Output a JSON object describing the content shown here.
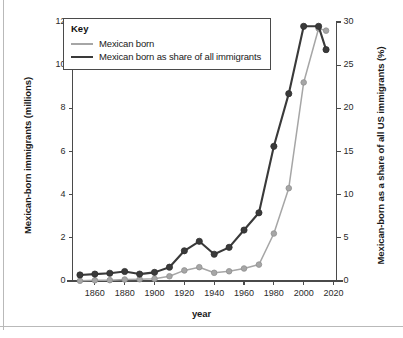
{
  "chart_data": {
    "type": "line",
    "title": "",
    "xlabel": "year",
    "ylabel": "Mexican-born immigrants (millions)",
    "ylabel_right": "Mexican-born as a share of all US immigrants (%)",
    "xlim": [
      1845,
      2022
    ],
    "ylim": [
      0,
      12
    ],
    "ylim_right": [
      0,
      30
    ],
    "xticks": [
      1860,
      1880,
      1900,
      1920,
      1940,
      1960,
      1980,
      2000,
      2020
    ],
    "xtick_labels": [
      "1860",
      "1880",
      "1900",
      "1920",
      "1940",
      "1960",
      "1980",
      "2000",
      "2020"
    ],
    "yticks": [
      0,
      2,
      4,
      6,
      8,
      10,
      12
    ],
    "ytick_labels": [
      "0",
      "2",
      "4",
      "6",
      "8",
      "10",
      "12"
    ],
    "yticks_right": [
      0,
      5,
      10,
      15,
      20,
      25,
      30
    ],
    "ytick_labels_right": [
      "0",
      "5",
      "10",
      "15",
      "20",
      "25",
      "30"
    ],
    "grid": false,
    "legend_position": "upper-left",
    "legend_title": "Key",
    "series": [
      {
        "name": "Mexican born",
        "axis": "left",
        "unit": "millions",
        "color": "#a6a6a6",
        "marker": "circle",
        "x": [
          1850,
          1860,
          1870,
          1880,
          1890,
          1900,
          1910,
          1920,
          1930,
          1940,
          1950,
          1960,
          1970,
          1980,
          1990,
          2000,
          2010,
          2015
        ],
        "values": [
          0.01,
          0.03,
          0.04,
          0.07,
          0.08,
          0.1,
          0.22,
          0.49,
          0.64,
          0.38,
          0.45,
          0.58,
          0.76,
          2.2,
          4.3,
          9.2,
          11.7,
          11.6
        ]
      },
      {
        "name": "Mexican born as share of all immigrants",
        "axis": "right",
        "unit": "%",
        "color": "#3a3a3a",
        "marker": "circle",
        "x": [
          1850,
          1860,
          1870,
          1880,
          1890,
          1900,
          1910,
          1920,
          1930,
          1940,
          1950,
          1960,
          1970,
          1980,
          1990,
          2000,
          2010,
          2015
        ],
        "values": [
          0.7,
          0.8,
          0.9,
          1.1,
          0.8,
          1.0,
          1.6,
          3.5,
          4.6,
          3.1,
          3.9,
          5.9,
          7.9,
          15.6,
          21.7,
          29.5,
          29.5,
          26.8
        ]
      }
    ]
  }
}
